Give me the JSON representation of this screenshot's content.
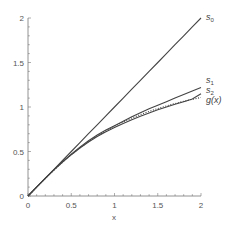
{
  "chart_data": {
    "type": "line",
    "title": "",
    "xlabel": "x",
    "ylabel": "",
    "xlim": [
      0,
      2
    ],
    "ylim": [
      0,
      2
    ],
    "grid": false,
    "legend": "inline labels at right end of curves",
    "x_ticks": [
      "0",
      "0.5",
      "1",
      "1.5",
      "2"
    ],
    "y_ticks": [
      "0",
      "0.5",
      "1",
      "1.5",
      "2"
    ],
    "x": [
      0,
      0.1,
      0.2,
      0.3,
      0.4,
      0.5,
      0.6,
      0.7,
      0.8,
      0.9,
      1.0,
      1.1,
      1.2,
      1.3,
      1.4,
      1.5,
      1.6,
      1.7,
      1.8,
      1.9,
      2.0
    ],
    "series": [
      {
        "name": "s0",
        "label_main": "s",
        "label_sub": "0",
        "style": "solid",
        "values": [
          0,
          0.1,
          0.2,
          0.3,
          0.4,
          0.5,
          0.6,
          0.7,
          0.8,
          0.9,
          1.0,
          1.1,
          1.2,
          1.3,
          1.4,
          1.5,
          1.6,
          1.7,
          1.8,
          1.9,
          2.0
        ]
      },
      {
        "name": "s1",
        "label_main": "s",
        "label_sub": "1",
        "style": "solid",
        "values": [
          0,
          0.1,
          0.199,
          0.295,
          0.385,
          0.47,
          0.55,
          0.62,
          0.685,
          0.74,
          0.79,
          0.84,
          0.89,
          0.935,
          0.98,
          1.02,
          1.06,
          1.1,
          1.14,
          1.18,
          1.22
        ]
      },
      {
        "name": "s2",
        "label_main": "s",
        "label_sub": "2",
        "style": "solid",
        "values": [
          0,
          0.1,
          0.198,
          0.293,
          0.382,
          0.464,
          0.539,
          0.607,
          0.668,
          0.722,
          0.77,
          0.815,
          0.857,
          0.896,
          0.933,
          0.968,
          1.0,
          1.03,
          1.06,
          1.09,
          1.15
        ]
      },
      {
        "name": "g(x)",
        "label_main": "g(x)",
        "label_sub": "",
        "style": "dotted",
        "values": [
          0,
          0.0997,
          0.1974,
          0.2915,
          0.3805,
          0.4636,
          0.5404,
          0.6107,
          0.6747,
          0.7328,
          0.7854,
          0.833,
          0.8761,
          0.9151,
          0.9505,
          0.9828,
          1.0122,
          1.0391,
          1.0637,
          1.0863,
          1.1071
        ]
      }
    ]
  },
  "colors": {
    "axis": "#777777",
    "line": "#444444",
    "text": "#555555"
  }
}
